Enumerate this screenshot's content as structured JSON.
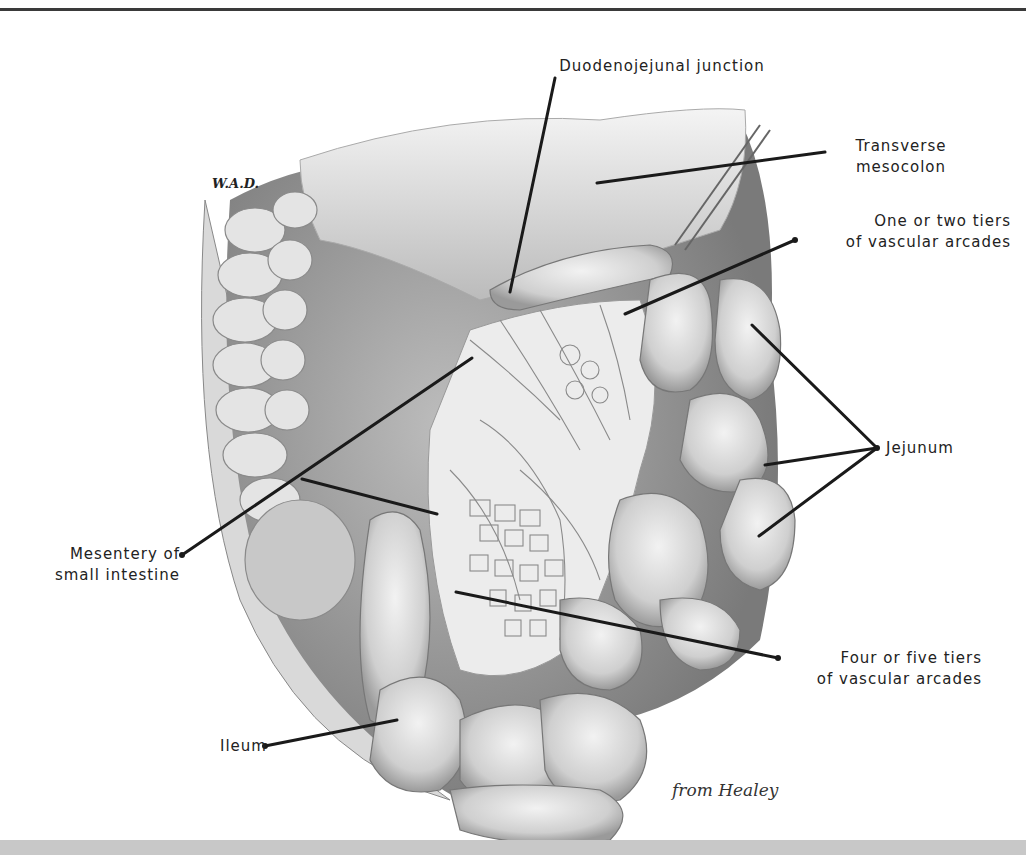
{
  "figure": {
    "artist_initials": "W.A.D.",
    "credit": "from Healey",
    "labels": {
      "duodenojejunal": "Duodenojejunal junction",
      "transverse_1": "Transverse",
      "transverse_2": "mesocolon",
      "one_two_1": "One or two tiers",
      "one_two_2": "of vascular arcades",
      "jejunum": "Jejunum",
      "mesentery_1": "Mesentery of",
      "mesentery_2": "small intestine",
      "four_five_1": "Four or five tiers",
      "four_five_2": "of vascular arcades",
      "ileum": "Ileum"
    }
  }
}
